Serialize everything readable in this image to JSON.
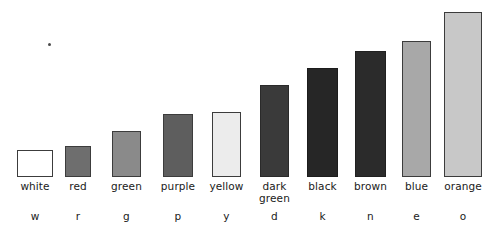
{
  "chart_data": {
    "type": "bar",
    "title": "",
    "subtitle": "",
    "xlabel": "",
    "ylabel": "",
    "grid": false,
    "legend": "none",
    "categories": [
      "white",
      "red",
      "green",
      "purple",
      "yellow",
      "dark green",
      "black",
      "brown",
      "blue",
      "orange"
    ],
    "category_codes": [
      "w",
      "r",
      "g",
      "p",
      "y",
      "d",
      "k",
      "n",
      "e",
      "o"
    ],
    "values": [
      27,
      31,
      46,
      63,
      65,
      92,
      109,
      126,
      136,
      165
    ],
    "value_unit": "relative bar height (px)",
    "ylim": [
      0,
      175
    ],
    "bars": [
      {
        "label": "white",
        "code": "w",
        "value": 27,
        "fill": "#ffffff",
        "stroke": "#3c3c3c",
        "left": 17,
        "width": 36,
        "top": 150,
        "height": 27,
        "label_lines": [
          "white"
        ]
      },
      {
        "label": "red",
        "code": "r",
        "value": 31,
        "fill": "#6e6e6e",
        "stroke": "#3c3c3c",
        "left": 65,
        "width": 26,
        "top": 146,
        "height": 31,
        "label_lines": [
          "red"
        ]
      },
      {
        "label": "green",
        "code": "g",
        "value": 46,
        "fill": "#8a8a8a",
        "stroke": "#3c3c3c",
        "left": 112,
        "width": 29,
        "top": 131,
        "height": 46,
        "label_lines": [
          "green"
        ]
      },
      {
        "label": "purple",
        "code": "p",
        "value": 63,
        "fill": "#5e5e5e",
        "stroke": "#3c3c3c",
        "left": 163,
        "width": 30,
        "top": 114,
        "height": 63,
        "label_lines": [
          "purple"
        ]
      },
      {
        "label": "yellow",
        "code": "y",
        "value": 65,
        "fill": "#ececec",
        "stroke": "#3c3c3c",
        "left": 212,
        "width": 29,
        "top": 112,
        "height": 65,
        "label_lines": [
          "yellow"
        ]
      },
      {
        "label": "dark green",
        "code": "d",
        "value": 92,
        "fill": "#3a3a3a",
        "stroke": "#2a2a2a",
        "left": 260,
        "width": 29,
        "top": 85,
        "height": 92,
        "label_lines": [
          "dark",
          "green"
        ]
      },
      {
        "label": "black",
        "code": "k",
        "value": 109,
        "fill": "#262626",
        "stroke": "#1c1c1c",
        "left": 307,
        "width": 31,
        "top": 68,
        "height": 109,
        "label_lines": [
          "black"
        ]
      },
      {
        "label": "brown",
        "code": "n",
        "value": 126,
        "fill": "#2b2b2b",
        "stroke": "#202020",
        "left": 355,
        "width": 31,
        "top": 51,
        "height": 126,
        "label_lines": [
          "brown"
        ]
      },
      {
        "label": "blue",
        "code": "e",
        "value": 136,
        "fill": "#a8a8a8",
        "stroke": "#3c3c3c",
        "left": 402,
        "width": 29,
        "top": 41,
        "height": 136,
        "label_lines": [
          "blue"
        ]
      },
      {
        "label": "orange",
        "code": "o",
        "value": 165,
        "fill": "#c8c8c8",
        "stroke": "#3c3c3c",
        "left": 444,
        "width": 38,
        "top": 12,
        "height": 165,
        "label_lines": [
          "orange"
        ]
      }
    ],
    "baseline_y": 177,
    "colors": {
      "background": "#ffffff",
      "text": "#1a1a1a",
      "bar_stroke": "#3c3c3c"
    }
  },
  "artifacts": [
    {
      "name": "scan-speck",
      "left": 48,
      "top": 43,
      "size": 3
    }
  ]
}
